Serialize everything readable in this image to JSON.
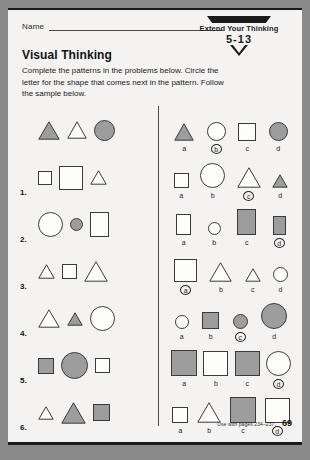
{
  "header": {
    "name_label": "Name",
    "banner_title": "Extend Your Thinking",
    "banner_code": "5-13"
  },
  "worksheet": {
    "title": "Visual Thinking",
    "instructions": "Complete the patterns in the problems below. Circle the letter for the shape that comes next in the pattern. Follow the sample below."
  },
  "footer": {
    "note": "Use with pages 234–237.",
    "page": "69"
  },
  "letters": [
    "a",
    "b",
    "c",
    "d"
  ],
  "rows": [
    {
      "number": "",
      "is_sample": true,
      "pattern": [
        {
          "shape": "triangle",
          "fill": "shaded",
          "size": 22
        },
        {
          "shape": "triangle",
          "fill": "white",
          "size": 20
        },
        {
          "shape": "circle",
          "fill": "shaded",
          "size": 21
        }
      ],
      "choices": [
        {
          "letter": "a",
          "shape": "triangle",
          "fill": "shaded",
          "size": 20,
          "circled": false
        },
        {
          "letter": "b",
          "shape": "circle",
          "fill": "white",
          "size": 19,
          "circled": true
        },
        {
          "letter": "c",
          "shape": "square",
          "fill": "white",
          "size": 18,
          "circled": false
        },
        {
          "letter": "d",
          "shape": "circle",
          "fill": "shaded",
          "size": 19,
          "circled": false
        }
      ],
      "answer": "b"
    },
    {
      "number": "1.",
      "is_sample": false,
      "pattern": [
        {
          "shape": "square",
          "fill": "white",
          "size": 14
        },
        {
          "shape": "square",
          "fill": "white",
          "size": 24
        },
        {
          "shape": "triangle",
          "fill": "white",
          "size": 17
        }
      ],
      "choices": [
        {
          "letter": "a",
          "shape": "square",
          "fill": "white",
          "size": 15,
          "circled": false
        },
        {
          "letter": "b",
          "shape": "circle",
          "fill": "white",
          "size": 25,
          "circled": false
        },
        {
          "letter": "c",
          "shape": "triangle",
          "fill": "white",
          "size": 24,
          "circled": true
        },
        {
          "letter": "d",
          "shape": "triangle",
          "fill": "shaded",
          "size": 16,
          "circled": false
        }
      ],
      "answer": "c"
    },
    {
      "number": "2.",
      "is_sample": false,
      "pattern": [
        {
          "shape": "circle",
          "fill": "white",
          "size": 25
        },
        {
          "shape": "circle",
          "fill": "shaded",
          "size": 13
        },
        {
          "shape": "rect",
          "fill": "white",
          "size": 19,
          "height": 25
        }
      ],
      "choices": [
        {
          "letter": "a",
          "shape": "rect",
          "fill": "white",
          "size": 15,
          "height": 21,
          "circled": false
        },
        {
          "letter": "b",
          "shape": "circle",
          "fill": "white",
          "size": 13,
          "circled": false
        },
        {
          "letter": "c",
          "shape": "rect",
          "fill": "shaded",
          "size": 19,
          "height": 26,
          "circled": false
        },
        {
          "letter": "d",
          "shape": "rect",
          "fill": "shaded",
          "size": 13,
          "height": 19,
          "circled": true
        }
      ],
      "answer": "d"
    },
    {
      "number": "3.",
      "is_sample": false,
      "pattern": [
        {
          "shape": "triangle",
          "fill": "white",
          "size": 17
        },
        {
          "shape": "square",
          "fill": "white",
          "size": 15
        },
        {
          "shape": "triangle",
          "fill": "white",
          "size": 24
        }
      ],
      "choices": [
        {
          "letter": "a",
          "shape": "square",
          "fill": "white",
          "size": 23,
          "circled": true
        },
        {
          "letter": "b",
          "shape": "triangle",
          "fill": "white",
          "size": 23,
          "circled": false
        },
        {
          "letter": "c",
          "shape": "triangle",
          "fill": "white",
          "size": 16,
          "circled": false
        },
        {
          "letter": "d",
          "shape": "circle",
          "fill": "white",
          "size": 15,
          "circled": false
        }
      ],
      "answer": "a"
    },
    {
      "number": "4.",
      "is_sample": false,
      "pattern": [
        {
          "shape": "triangle",
          "fill": "white",
          "size": 22
        },
        {
          "shape": "triangle",
          "fill": "shaded",
          "size": 16
        },
        {
          "shape": "circle",
          "fill": "white",
          "size": 25
        }
      ],
      "choices": [
        {
          "letter": "a",
          "shape": "circle",
          "fill": "white",
          "size": 14,
          "circled": false
        },
        {
          "letter": "b",
          "shape": "square",
          "fill": "shaded",
          "size": 17,
          "circled": false
        },
        {
          "letter": "c",
          "shape": "circle",
          "fill": "shaded",
          "size": 15,
          "circled": true
        },
        {
          "letter": "d",
          "shape": "circle",
          "fill": "shaded",
          "size": 26,
          "circled": false
        }
      ],
      "answer": "c"
    },
    {
      "number": "5.",
      "is_sample": false,
      "pattern": [
        {
          "shape": "square",
          "fill": "shaded",
          "size": 16
        },
        {
          "shape": "circle",
          "fill": "shaded",
          "size": 27
        },
        {
          "shape": "square",
          "fill": "white",
          "size": 15
        }
      ],
      "choices": [
        {
          "letter": "a",
          "shape": "square",
          "fill": "shaded",
          "size": 26,
          "circled": false
        },
        {
          "letter": "b",
          "shape": "square",
          "fill": "white",
          "size": 25,
          "circled": false
        },
        {
          "letter": "c",
          "shape": "square",
          "fill": "shaded",
          "size": 25,
          "circled": false
        },
        {
          "letter": "d",
          "shape": "circle",
          "fill": "white",
          "size": 25,
          "circled": true
        }
      ],
      "answer": "d"
    },
    {
      "number": "6.",
      "is_sample": false,
      "pattern": [
        {
          "shape": "triangle",
          "fill": "white",
          "size": 16
        },
        {
          "shape": "triangle",
          "fill": "shaded",
          "size": 25
        },
        {
          "shape": "square",
          "fill": "shaded",
          "size": 17
        }
      ],
      "choices": [
        {
          "letter": "a",
          "shape": "square",
          "fill": "white",
          "size": 16,
          "circled": false
        },
        {
          "letter": "b",
          "shape": "triangle",
          "fill": "white",
          "size": 24,
          "circled": false
        },
        {
          "letter": "c",
          "shape": "square",
          "fill": "shaded",
          "size": 26,
          "circled": false
        },
        {
          "letter": "d",
          "shape": "square",
          "fill": "white",
          "size": 25,
          "circled": true
        }
      ],
      "answer": "d"
    }
  ]
}
